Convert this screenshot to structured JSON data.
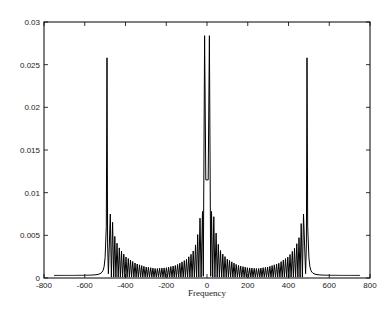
{
  "chart_data": {
    "type": "line",
    "title": "",
    "xlabel": "Frequency",
    "ylabel": "",
    "xlim": [
      -800,
      800
    ],
    "ylim": [
      0,
      0.03
    ],
    "grid": false,
    "legend": null,
    "x_ticks": [
      -800,
      -600,
      -400,
      -200,
      0,
      200,
      400,
      600,
      800
    ],
    "x_tick_labels": [
      "-800",
      "-600",
      "-400",
      "-200",
      "0",
      "200",
      "400",
      "600",
      "800"
    ],
    "y_ticks": [
      0,
      0.005,
      0.01,
      0.015,
      0.02,
      0.025,
      0.03
    ],
    "y_tick_labels": [
      "0",
      "0.005",
      "0.01",
      "0.015",
      "0.02",
      "0.025",
      "0.03"
    ],
    "series": [
      {
        "name": "spectrum",
        "color": "#000000",
        "description": "Symmetric magnitude spectrum with three main peaks (near -490, 0, +490) and oscillating sidelobes decaying away from each peak",
        "peaks": [
          {
            "x": -490,
            "y": 0.0258
          },
          {
            "x": -8,
            "y": 0.0284
          },
          {
            "x": 8,
            "y": 0.0284
          },
          {
            "x": 490,
            "y": 0.0258
          }
        ],
        "sidelobe_envelope": [
          {
            "x": -470,
            "y": 0.0075
          },
          {
            "x": -450,
            "y": 0.0045
          },
          {
            "x": -430,
            "y": 0.0035
          },
          {
            "x": -400,
            "y": 0.0025
          },
          {
            "x": -350,
            "y": 0.0017
          },
          {
            "x": -300,
            "y": 0.0013
          },
          {
            "x": -250,
            "y": 0.0011
          },
          {
            "x": -200,
            "y": 0.0012
          },
          {
            "x": -150,
            "y": 0.0015
          },
          {
            "x": -100,
            "y": 0.0022
          },
          {
            "x": -70,
            "y": 0.003
          },
          {
            "x": -50,
            "y": 0.0043
          },
          {
            "x": -30,
            "y": 0.0078
          },
          {
            "x": 30,
            "y": 0.0078
          },
          {
            "x": 50,
            "y": 0.0043
          },
          {
            "x": 70,
            "y": 0.003
          },
          {
            "x": 100,
            "y": 0.0022
          },
          {
            "x": 150,
            "y": 0.0015
          },
          {
            "x": 200,
            "y": 0.0012
          },
          {
            "x": 250,
            "y": 0.0011
          },
          {
            "x": 300,
            "y": 0.0013
          },
          {
            "x": 350,
            "y": 0.0017
          },
          {
            "x": 400,
            "y": 0.0025
          },
          {
            "x": 430,
            "y": 0.0035
          },
          {
            "x": 450,
            "y": 0.0045
          },
          {
            "x": 470,
            "y": 0.0075
          }
        ],
        "tails": [
          {
            "x": -750,
            "y": 0.0003
          },
          {
            "x": -600,
            "y": 0.0005
          },
          {
            "x": -520,
            "y": 0.0015
          },
          {
            "x": 520,
            "y": 0.0015
          },
          {
            "x": 600,
            "y": 0.0005
          },
          {
            "x": 750,
            "y": 0.0003
          }
        ]
      }
    ]
  }
}
